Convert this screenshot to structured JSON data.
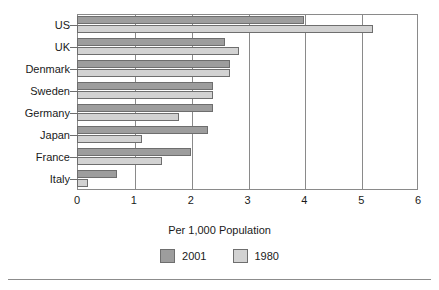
{
  "chart_data": {
    "type": "bar",
    "orientation": "horizontal",
    "title": "",
    "xlabel": "Per 1,000 Population",
    "ylabel": "",
    "xlim": [
      0,
      6
    ],
    "xticks": [
      "0",
      "1",
      "2",
      "3",
      "4",
      "5",
      "6"
    ],
    "grid": "vertical",
    "legend_position": "bottom",
    "categories": [
      "US",
      "UK",
      "Denmark",
      "Sweden",
      "Germany",
      "Japan",
      "France",
      "Italy"
    ],
    "series": [
      {
        "name": "2001",
        "color": "#9d9d9d",
        "values": [
          4.0,
          2.6,
          2.7,
          2.4,
          2.4,
          2.3,
          2.0,
          0.7
        ]
      },
      {
        "name": "1980",
        "color": "#d2d2d2",
        "values": [
          5.2,
          2.85,
          2.7,
          2.4,
          1.8,
          1.15,
          1.5,
          0.2
        ]
      }
    ]
  },
  "legend": {
    "items": [
      {
        "label": "2001",
        "color": "#9d9d9d"
      },
      {
        "label": "1980",
        "color": "#d2d2d2"
      }
    ]
  },
  "axis": {
    "x_title": "Per 1,000 Population"
  }
}
